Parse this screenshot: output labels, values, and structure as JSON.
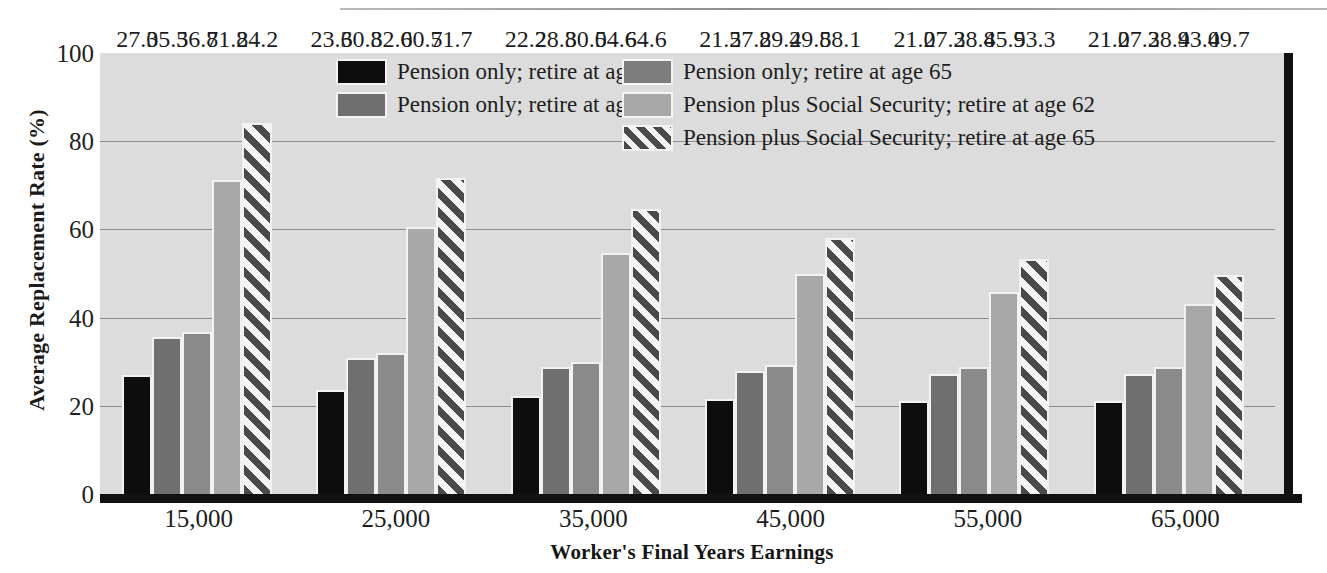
{
  "chart_data": {
    "type": "bar",
    "title": "",
    "xlabel": "Worker's Final Years Earnings",
    "ylabel": "Average Replacement Rate (%)",
    "ylim": [
      0,
      100
    ],
    "yticks": [
      "0",
      "20",
      "40",
      "60",
      "80",
      "100"
    ],
    "grid": true,
    "legend_position": "top-center-inside",
    "categories": [
      "15,000",
      "25,000",
      "35,000",
      "45,000",
      "55,000",
      "65,000"
    ],
    "series": [
      {
        "name": "Pension only; retire at age 55",
        "color": "#0d0d0d",
        "pattern": "solid",
        "values": [
          27.0,
          23.6,
          22.2,
          21.5,
          21.0,
          21.0
        ],
        "labels": [
          "27.0",
          "23.6",
          "22.2",
          "21.5",
          "21.0",
          "21.0"
        ]
      },
      {
        "name": "Pension only; retire at age 62",
        "color": "#6f6f6f",
        "pattern": "solid",
        "values": [
          35.5,
          30.8,
          28.8,
          27.8,
          27.3,
          27.3
        ],
        "labels": [
          "35.5",
          "30.8",
          "28.8",
          "27.8",
          "27.3",
          "27.3"
        ]
      },
      {
        "name": "Pension only; retire at age 65",
        "color": "#8a8a8a",
        "pattern": "solid",
        "values": [
          36.8,
          32.0,
          30.0,
          29.2,
          28.8,
          28.9
        ],
        "labels": [
          "36.8",
          "32.0",
          "30.0",
          "29.2",
          "28.8",
          "28.9"
        ]
      },
      {
        "name": "Pension plus Social Security; retire at age 62",
        "color": "#a8a8a8",
        "pattern": "solid",
        "values": [
          71.2,
          60.5,
          54.6,
          49.8,
          45.9,
          43.0
        ],
        "labels": [
          "71.2",
          "60.5",
          "54.6",
          "49.8",
          "45.9",
          "43.0"
        ]
      },
      {
        "name": "Pension plus Social Security; retire at age 65",
        "color": "#4a4a4a",
        "pattern": "diagonal-hatch",
        "values": [
          84.2,
          71.7,
          64.6,
          58.1,
          53.3,
          49.7
        ],
        "labels": [
          "84.2",
          "71.7",
          "64.6",
          "58.1",
          "53.3",
          "49.7"
        ]
      }
    ]
  },
  "legend": {
    "columns": [
      {
        "items": [
          {
            "label": "Pension only; retire at age 55",
            "swatch": "series-0-swatch"
          },
          {
            "label": "Pension only; retire at age 62",
            "swatch": "series-1-swatch"
          }
        ]
      },
      {
        "items": [
          {
            "label": "Pension only; retire at age 65",
            "swatch": "series-2-swatch"
          },
          {
            "label": "Pension plus Social Security; retire at age 62",
            "swatch": "series-3-swatch"
          },
          {
            "label": "Pension plus Social Security; retire at age 65",
            "swatch": "series-4-swatch"
          }
        ]
      }
    ]
  },
  "colors": {
    "plot_background": "#dcdcdc",
    "axis": "#111111",
    "gridline": "#8e8e8e",
    "text": "#1d1d1d"
  }
}
